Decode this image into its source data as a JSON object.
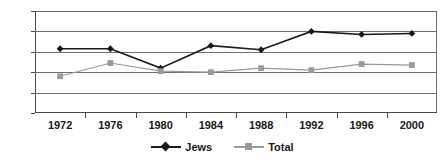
{
  "chart_data": {
    "type": "line",
    "title": "",
    "xlabel": "",
    "ylabel": "",
    "categories": [
      "1972",
      "1976",
      "1980",
      "1984",
      "1988",
      "1992",
      "1996",
      "2000"
    ],
    "x": [
      1972,
      1976,
      1980,
      1984,
      1988,
      1992,
      1996,
      2000
    ],
    "series": [
      {
        "name": "Jews",
        "color": "#1a1a1a",
        "marker": "diamond",
        "values": [
          63,
          63,
          44,
          66,
          62,
          80,
          77,
          78
        ]
      },
      {
        "name": "Total",
        "color": "#9a9a9a",
        "marker": "square",
        "values": [
          36,
          49,
          41,
          40,
          44,
          42,
          48,
          47
        ]
      }
    ],
    "ylim": [
      0,
      100
    ],
    "yticks": [
      0,
      20,
      40,
      60,
      80,
      100
    ],
    "ytick_labels": [
      "0",
      "20",
      "40",
      "60",
      "80",
      "100"
    ],
    "grid": true,
    "grid_axis": "y",
    "legend_position": "bottom",
    "legend_entries": [
      "Jews",
      "Total"
    ]
  },
  "legend": {
    "items": [
      {
        "label": "Jews"
      },
      {
        "label": "Total"
      }
    ]
  },
  "colors": {
    "jews": "#1a1a1a",
    "total": "#9a9a9a",
    "grid": "#707070",
    "axis": "#4a4a4a",
    "background": "#ffffff"
  }
}
